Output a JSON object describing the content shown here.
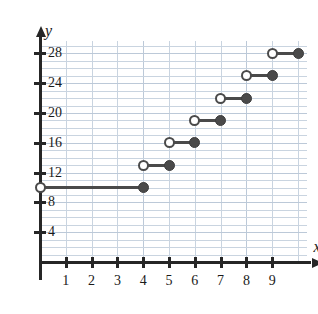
{
  "chart_data": {
    "type": "line",
    "subtype": "step-function",
    "title": "",
    "xlabel": "x",
    "ylabel": "y",
    "xlim": [
      0,
      10
    ],
    "ylim": [
      0,
      30
    ],
    "grid": true,
    "grid_step": 1,
    "legend": "none",
    "x_ticks": [
      1,
      2,
      3,
      4,
      5,
      6,
      7,
      8,
      9
    ],
    "x_tick_labels": [
      "1",
      "2",
      "3",
      "4",
      "5",
      "6",
      "7",
      "8",
      "9"
    ],
    "y_ticks": [
      4,
      8,
      12,
      16,
      20,
      24,
      28
    ],
    "y_tick_labels": [
      "4",
      "8",
      "12",
      "16",
      "20",
      "24",
      "28"
    ],
    "marker_color": "#4a4a4a",
    "grid_color": "#c9d4e0",
    "axis_color": "#262626",
    "segments": [
      {
        "x_start": 0,
        "x_end": 4,
        "y": 10,
        "left_endpoint": "open",
        "right_endpoint": "closed"
      },
      {
        "x_start": 4,
        "x_end": 5,
        "y": 13,
        "left_endpoint": "open",
        "right_endpoint": "closed"
      },
      {
        "x_start": 5,
        "x_end": 6,
        "y": 16,
        "left_endpoint": "open",
        "right_endpoint": "closed"
      },
      {
        "x_start": 6,
        "x_end": 7,
        "y": 19,
        "left_endpoint": "open",
        "right_endpoint": "closed"
      },
      {
        "x_start": 7,
        "x_end": 8,
        "y": 22,
        "left_endpoint": "open",
        "right_endpoint": "closed"
      },
      {
        "x_start": 8,
        "x_end": 9,
        "y": 25,
        "left_endpoint": "open",
        "right_endpoint": "closed"
      },
      {
        "x_start": 9,
        "x_end": 10,
        "y": 28,
        "left_endpoint": "open",
        "right_endpoint": "closed"
      }
    ]
  }
}
